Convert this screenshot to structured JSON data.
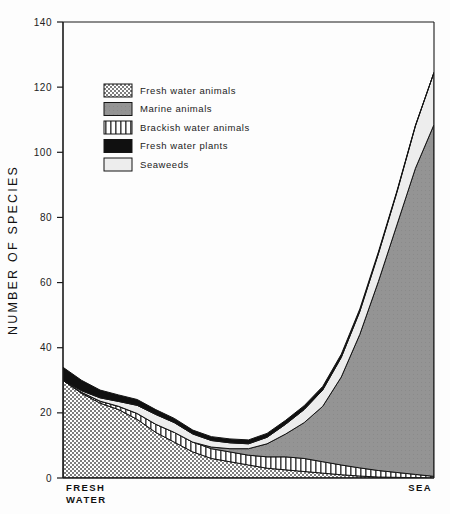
{
  "figure": {
    "caption": ""
  },
  "axes": {
    "y_title": "NUMBER OF SPECIES",
    "y_ticks": [
      0,
      20,
      40,
      60,
      80,
      100,
      120,
      140
    ],
    "x_label_left_line1": "FRESH",
    "x_label_left_line2": "WATER",
    "x_label_right": "SEA"
  },
  "legend": {
    "items": [
      {
        "label": "Fresh water animals",
        "pattern": "checker",
        "color": "#8a8a8a"
      },
      {
        "label": "Marine animals",
        "pattern": "solid-gray",
        "color": "#8f8f8f"
      },
      {
        "label": "Brackish water animals",
        "pattern": "vertical-stripes",
        "color": "#ffffff"
      },
      {
        "label": "Fresh water plants",
        "pattern": "solid-black",
        "color": "#111111"
      },
      {
        "label": "Seaweeds",
        "pattern": "light",
        "color": "#e8e8e8"
      }
    ]
  },
  "chart_data": {
    "type": "area",
    "stacked": true,
    "title": "",
    "xlabel": "",
    "ylabel": "NUMBER OF SPECIES",
    "ylim": [
      0,
      140
    ],
    "xlim": [
      0,
      100
    ],
    "grid": false,
    "legend_position": "upper-left-inside",
    "x_axis_categories": [
      "FRESH WATER",
      "SEA"
    ],
    "x": [
      0,
      5,
      10,
      15,
      20,
      25,
      30,
      35,
      40,
      45,
      50,
      55,
      60,
      65,
      70,
      75,
      80,
      85,
      90,
      95,
      100
    ],
    "series": [
      {
        "name": "Fresh water animals",
        "pattern": "checker",
        "values": [
          30,
          26,
          23,
          21,
          18,
          14,
          11,
          8,
          6,
          5,
          4,
          3,
          2.5,
          2,
          1.5,
          1,
          0.6,
          0.3,
          0.2,
          0.1,
          0
        ]
      },
      {
        "name": "Brackish water animals",
        "pattern": "vertical-stripes",
        "values": [
          0,
          0.3,
          0.6,
          1,
          1.8,
          2.5,
          3,
          3,
          3,
          3,
          3,
          3.5,
          4,
          4,
          3.5,
          3,
          2.5,
          2,
          1.5,
          1,
          0.5
        ]
      },
      {
        "name": "Marine animals",
        "pattern": "solid-gray",
        "values": [
          0,
          0,
          0,
          0,
          0,
          0,
          0,
          0,
          0.5,
          1,
          2,
          4,
          7,
          11,
          17,
          27,
          41,
          58,
          76,
          94,
          108
        ]
      },
      {
        "name": "Seaweeds",
        "pattern": "light",
        "values": [
          0,
          0.5,
          1,
          1.5,
          2.5,
          3,
          3,
          2.5,
          2,
          1.8,
          1.5,
          2,
          3,
          4,
          5,
          6,
          7,
          8.5,
          10,
          13,
          16
        ]
      },
      {
        "name": "Fresh water plants",
        "pattern": "solid-black",
        "values": [
          4,
          3.2,
          2.4,
          2,
          1.8,
          1.5,
          1.3,
          1.2,
          1.2,
          1.2,
          1.2,
          1.2,
          1.2,
          1.2,
          1.1,
          1,
          0.8,
          0.6,
          0.4,
          0.2,
          0
        ]
      }
    ],
    "totals": [
      34,
      30,
      27,
      25.5,
      24.1,
      21,
      18.3,
      14.7,
      12.7,
      12,
      11.7,
      13.7,
      17.7,
      22.2,
      28.1,
      38,
      51.9,
      69.4,
      88.1,
      108.3,
      124.5
    ]
  }
}
